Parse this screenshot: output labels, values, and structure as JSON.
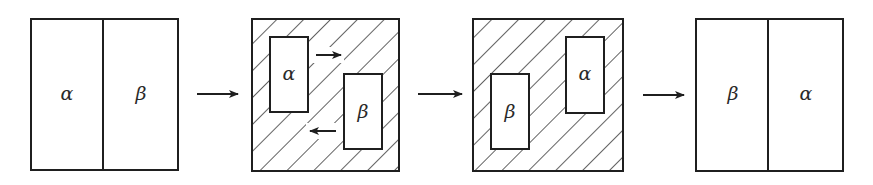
{
  "diagram": {
    "stages": [
      {
        "id": "stage-1",
        "kind": "split",
        "left_label": "α",
        "right_label": "β"
      },
      {
        "id": "stage-2",
        "kind": "hatched",
        "upper_label": "α",
        "lower_label": "β",
        "motion_arrows": [
          "right",
          "left"
        ]
      },
      {
        "id": "stage-3",
        "kind": "hatched",
        "upper_label": "α",
        "lower_label": "β"
      },
      {
        "id": "stage-4",
        "kind": "split",
        "left_label": "β",
        "right_label": "α"
      }
    ],
    "transition_arrows": 3,
    "colors": {
      "line": "#1f1f1f",
      "background": "#ffffff"
    }
  }
}
